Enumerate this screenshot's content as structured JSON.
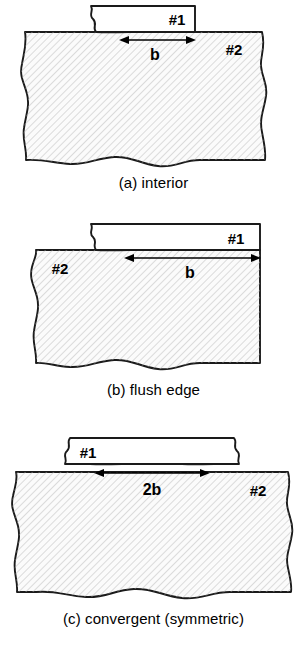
{
  "figure": {
    "colors": {
      "outline": "#1a1a1a",
      "hatch": "#b4b4b4",
      "fill": "#fbfbfb",
      "text": "#000000",
      "background": "#ffffff"
    },
    "hatch": {
      "angle_deg": 45,
      "spacing_px": 5,
      "stroke_width_px": 0.9
    }
  },
  "panels": [
    {
      "id": "a",
      "caption": "(a) interior",
      "label_strip": "#1",
      "label_block": "#2",
      "dimension": "b",
      "description": "Thin strip #1 bonded on the interior of substrate #2; strip is broken on the left, terminates at an interior edge on the right.",
      "strip_break_left": true,
      "strip_break_right": false,
      "block_edge_left": "wavy",
      "block_edge_right": "wavy",
      "block_edge_bottom": "wavy"
    },
    {
      "id": "b",
      "caption": "(b) flush edge",
      "label_strip": "#1",
      "label_block": "#2",
      "dimension": "b",
      "description": "Strip #1 bonded flush with the right edge of substrate #2; dimension b spans from the strip break to the flush edge.",
      "strip_break_left": true,
      "strip_break_right": false,
      "block_edge_left": "wavy",
      "block_edge_right": "straight",
      "block_edge_bottom": "wavy"
    },
    {
      "id": "c",
      "caption": "(c) convergent (symmetric)",
      "label_strip": "#1",
      "label_block": "#2",
      "dimension": "2b",
      "description": "Strip #1 broken on both ends, symmetric convergent bond of width 2b centered on substrate #2.",
      "strip_break_left": true,
      "strip_break_right": true,
      "block_edge_left": "wavy",
      "block_edge_right": "wavy",
      "block_edge_bottom": "wavy"
    }
  ]
}
